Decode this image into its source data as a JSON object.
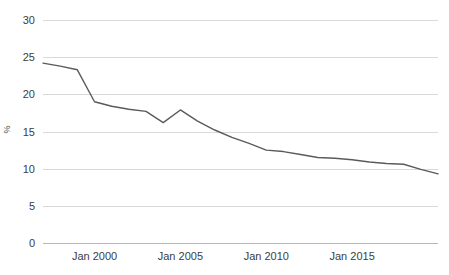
{
  "chart_data": {
    "type": "line",
    "title": "",
    "subtitle": "",
    "xlabel": "",
    "ylabel": "%",
    "ylim": [
      0,
      30
    ],
    "yticks": [
      0,
      5,
      10,
      15,
      20,
      25,
      30
    ],
    "ytick_labels": [
      "0",
      "5",
      "10",
      "15",
      "20",
      "25",
      "30"
    ],
    "xlim": [
      1997,
      2020
    ],
    "xticks": [
      2000,
      2005,
      2010,
      2015
    ],
    "xtick_labels": [
      "Jan 2000",
      "Jan 2005",
      "Jan 2010",
      "Jan 2015"
    ],
    "grid": "horizontal",
    "legend": "none",
    "line_color": "#5a5a5a",
    "grid_color": "#d9d9d9",
    "axis_color": "#b8b8b8",
    "series": [
      {
        "name": "Percent",
        "x": [
          1997,
          1998,
          1999,
          2000,
          2001,
          2002,
          2003,
          2004,
          2005,
          2006,
          2007,
          2008,
          2009,
          2010,
          2011,
          2012,
          2013,
          2014,
          2015,
          2016,
          2017,
          2018,
          2019,
          2020
        ],
        "values": [
          24.2,
          23.8,
          23.3,
          19.0,
          18.4,
          18.0,
          17.7,
          16.2,
          17.9,
          16.4,
          15.2,
          14.2,
          13.4,
          12.5,
          12.3,
          11.9,
          11.5,
          11.4,
          11.2,
          10.9,
          10.7,
          10.6,
          9.9,
          9.3
        ]
      }
    ]
  }
}
